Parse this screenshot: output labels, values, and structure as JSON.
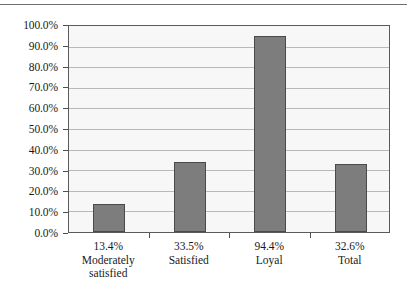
{
  "page": {
    "has_top_rule": true
  },
  "chart_data": {
    "type": "bar",
    "title": "",
    "subtitle": "",
    "xlabel": "",
    "ylabel": "",
    "ylim": [
      0,
      100
    ],
    "grid": true,
    "legend": false,
    "legend_position": "none",
    "value_suffix": "%",
    "plot_background": "#f7f7f7",
    "bar_fill": "#7d7d7d",
    "bar_border": "#4a4a4a",
    "gridline_color": "#b9b9b9",
    "axis_color": "#5a5a5a",
    "categories": [
      "Moderately satisfied",
      "Satisfied",
      "Loyal",
      "Total"
    ],
    "values": [
      13.4,
      33.5,
      94.4,
      32.6
    ],
    "value_labels": [
      "13.4%",
      "33.5%",
      "94.4%",
      "32.6%"
    ],
    "category_lines": [
      [
        "Moderately",
        "satisfied"
      ],
      [
        "Satisfied"
      ],
      [
        "Loyal"
      ],
      [
        "Total"
      ]
    ],
    "y_ticks": [
      0,
      10,
      20,
      30,
      40,
      50,
      60,
      70,
      80,
      90,
      100
    ],
    "y_tick_labels": [
      "0.0%",
      "10.0%",
      "20.0%",
      "30.0%",
      "40.0%",
      "50.0%",
      "60.0%",
      "70.0%",
      "80.0%",
      "90.0%",
      "100.0%"
    ]
  },
  "axis": {
    "y": {
      "t100": "100.0%",
      "t90": "90.0%",
      "t80": "80.0%",
      "t70": "70.0%",
      "t60": "60.0%",
      "t50": "50.0%",
      "t40": "40.0%",
      "t30": "30.0%",
      "t20": "20.0%",
      "t10": "10.0%",
      "t0": "0.0%"
    }
  },
  "x_axis_items": [
    {
      "pct": "13.4%",
      "line1": "Moderately",
      "line2": "satisfied"
    },
    {
      "pct": "33.5%",
      "line1": "Satisfied",
      "line2": ""
    },
    {
      "pct": "94.4%",
      "line1": "Loyal",
      "line2": ""
    },
    {
      "pct": "32.6%",
      "line1": "Total",
      "line2": ""
    }
  ]
}
